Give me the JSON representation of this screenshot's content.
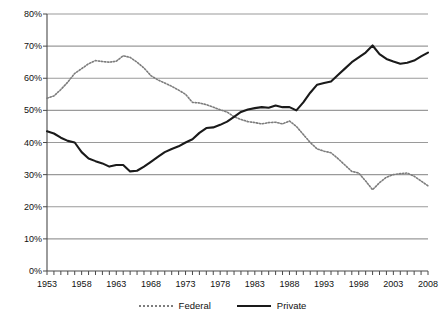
{
  "chart_data": {
    "type": "line",
    "title": "",
    "xlabel": "",
    "ylabel": "",
    "xlim": [
      1953,
      2008
    ],
    "ylim": [
      0,
      80
    ],
    "ytick_labels": [
      "0%",
      "10%",
      "20%",
      "30%",
      "40%",
      "50%",
      "60%",
      "70%",
      "80%"
    ],
    "ytick_values": [
      0,
      10,
      20,
      30,
      40,
      50,
      60,
      70,
      80
    ],
    "xtick_labels": [
      "1953",
      "1958",
      "1963",
      "1968",
      "1973",
      "1978",
      "1983",
      "1988",
      "1993",
      "1998",
      "2003",
      "2008"
    ],
    "xtick_values": [
      1953,
      1958,
      1963,
      1968,
      1973,
      1978,
      1983,
      1988,
      1993,
      1998,
      2003,
      2008
    ],
    "grid": "horizontal",
    "legend_position": "bottom",
    "x": [
      1953,
      1954,
      1955,
      1956,
      1957,
      1958,
      1959,
      1960,
      1961,
      1962,
      1963,
      1964,
      1965,
      1966,
      1967,
      1968,
      1969,
      1970,
      1971,
      1972,
      1973,
      1974,
      1975,
      1976,
      1977,
      1978,
      1979,
      1980,
      1981,
      1982,
      1983,
      1984,
      1985,
      1986,
      1987,
      1988,
      1989,
      1990,
      1991,
      1992,
      1993,
      1994,
      1995,
      1996,
      1997,
      1998,
      1999,
      2000,
      2001,
      2002,
      2003,
      2004,
      2005,
      2006,
      2007,
      2008
    ],
    "series": [
      {
        "name": "Federal",
        "style": "dotted",
        "color": "#7d7d7d",
        "values": [
          53.8,
          54.5,
          56.5,
          58.8,
          61.5,
          63.0,
          64.5,
          65.5,
          65.2,
          65.0,
          65.3,
          67.0,
          66.5,
          65.0,
          63.2,
          60.8,
          59.5,
          58.5,
          57.5,
          56.3,
          55.0,
          52.5,
          52.3,
          51.8,
          51.0,
          50.2,
          49.5,
          48.0,
          47.2,
          46.5,
          46.2,
          45.8,
          46.2,
          46.3,
          45.8,
          46.7,
          45.0,
          42.5,
          40.0,
          38.0,
          37.3,
          36.8,
          35.0,
          33.0,
          31.0,
          30.5,
          28.0,
          25.3,
          27.5,
          29.2,
          30.0,
          30.3,
          30.5,
          29.5,
          28.0,
          26.5
        ]
      },
      {
        "name": "Private",
        "style": "solid",
        "color": "#1a1a1a",
        "values": [
          43.5,
          42.8,
          41.5,
          40.5,
          40.0,
          37.0,
          35.0,
          34.2,
          33.5,
          32.5,
          33.0,
          33.0,
          31.0,
          31.2,
          32.5,
          34.0,
          35.5,
          37.0,
          38.0,
          38.8,
          40.0,
          41.0,
          43.0,
          44.5,
          44.7,
          45.5,
          46.5,
          48.0,
          49.5,
          50.3,
          50.7,
          51.0,
          50.8,
          51.5,
          51.0,
          51.0,
          50.0,
          52.5,
          55.5,
          58.0,
          58.5,
          59.0,
          61.0,
          63.0,
          65.0,
          66.5,
          68.0,
          70.2,
          67.5,
          66.0,
          65.2,
          64.5,
          64.8,
          65.5,
          66.8,
          68.0
        ]
      }
    ]
  },
  "legend": {
    "items": [
      {
        "label": "Federal"
      },
      {
        "label": "Private"
      }
    ]
  },
  "colors": {
    "federal": "#7d7d7d",
    "private": "#1a1a1a",
    "grid": "#9a9a9a",
    "axis": "#4a4a4a",
    "text": "#111111"
  }
}
